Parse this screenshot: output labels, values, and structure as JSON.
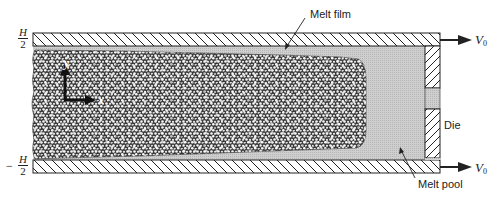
{
  "figure": {
    "type": "schematic"
  },
  "labels": {
    "melt_film": "Melt film",
    "die": "Die",
    "melt_pool": "Melt pool",
    "velocity_top": "V",
    "velocity_top_sub": "0",
    "velocity_bottom": "V",
    "velocity_bottom_sub": "0",
    "top_coord_num": "H",
    "top_coord_den": "2",
    "bottom_coord_sign": "−",
    "bottom_coord_num": "H",
    "bottom_coord_den": "2",
    "axis_x": "x",
    "axis_y": "y"
  },
  "colors": {
    "line": "#222222",
    "melt": "#c8c8c8",
    "solid_bed_dark": "#3a3a3a",
    "solid_bed_light": "#f2f2f2",
    "background": "#ffffff"
  }
}
